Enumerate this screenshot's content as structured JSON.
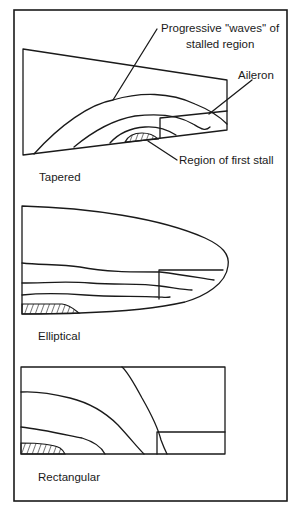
{
  "figure": {
    "callouts": {
      "waves_line1": "Progressive ''waves'' of",
      "waves_line2": "stalled region",
      "aileron": "Aileron",
      "first_stall": "Region of first stall"
    },
    "panels": [
      {
        "id": "tapered",
        "label": "Tapered"
      },
      {
        "id": "elliptical",
        "label": "Elliptical"
      },
      {
        "id": "rectangular",
        "label": "Rectangular"
      }
    ],
    "colors": {
      "line": "#1a1a1a",
      "background": "#ffffff"
    }
  }
}
